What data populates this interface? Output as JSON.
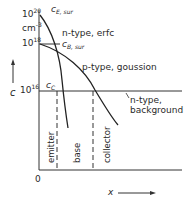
{
  "diagram": {
    "y_axis": {
      "label": "c",
      "unit": "cm",
      "unit_exp": "-3",
      "ticks": [
        {
          "base": "10",
          "exp": "20"
        },
        {
          "base": "10",
          "exp": "18"
        },
        {
          "base": "10",
          "exp": "16"
        }
      ]
    },
    "x_axis": {
      "label": "x",
      "origin": "0"
    },
    "markers": {
      "c_e_sur": {
        "main": "c",
        "sub": "E, sur"
      },
      "c_b_sur": {
        "main": "c",
        "sub": "B, sur"
      },
      "c_c": {
        "main": "c",
        "sub": "C"
      }
    },
    "curves": [
      {
        "name": "n-type, erfc"
      },
      {
        "name": "p-type, gaussian",
        "display": "p-type, goussion"
      },
      {
        "name": "n-type, background",
        "line1": "n-type,",
        "line2": "background"
      }
    ],
    "regions": [
      "emitter",
      "base",
      "collector"
    ]
  }
}
